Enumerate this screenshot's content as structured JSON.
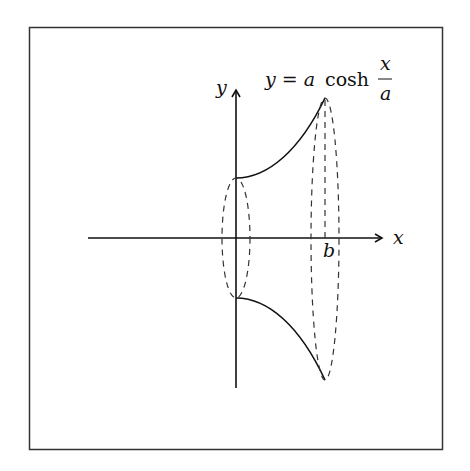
{
  "figure": {
    "axis_x_label": "x",
    "axis_y_label": "y",
    "equation": {
      "lhs": "y = a",
      "func": "cosh",
      "numerator": "x",
      "denominator": "a"
    },
    "tick_label_b": "b",
    "colors": {
      "stroke": "#111111",
      "frame": "#333333",
      "background": "#ffffff"
    }
  }
}
